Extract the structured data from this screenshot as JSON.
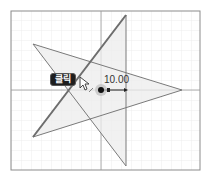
{
  "canvas": {
    "background": "#ffffff",
    "border_color": "#8c8c8c",
    "grid_color": "#e6e6e6",
    "axis_color": "#9a9a9a",
    "bounds": {
      "x": 11,
      "y": 11,
      "w": 189,
      "h": 159
    },
    "origin": {
      "x": 101,
      "y": 90
    }
  },
  "star": {
    "fill": "#ececec",
    "stroke": "#7a7a7a",
    "vertices": [
      [
        126,
        15
      ],
      [
        126,
        166
      ],
      [
        33,
        44
      ],
      [
        182,
        90
      ],
      [
        33,
        137
      ]
    ]
  },
  "highlighted_line": {
    "from": [
      33,
      137
    ],
    "to": [
      126,
      15
    ],
    "color": "#6e6e6e"
  },
  "tooltip": {
    "label": "클릭"
  },
  "dimension": {
    "value": "10.00"
  },
  "center_point": {
    "x": 101,
    "y": 90,
    "color": "#111111",
    "halo_color": "#bdbdbd"
  }
}
